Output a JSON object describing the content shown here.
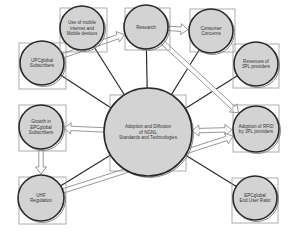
{
  "diagram": {
    "nodes": [
      {
        "id": "upcglobal",
        "lines": [
          "UPCglobal",
          "Subscribers"
        ]
      },
      {
        "id": "mobile",
        "lines": [
          "Use of mobile",
          "internet and",
          "Mobile devices"
        ]
      },
      {
        "id": "research",
        "lines": [
          "Research"
        ]
      },
      {
        "id": "consumer",
        "lines": [
          "Consumer",
          "Concerns"
        ]
      },
      {
        "id": "revenues",
        "lines": [
          "Revenues of",
          "3PL providers"
        ]
      },
      {
        "id": "center",
        "lines": [
          "Adoption and Diffusion",
          "of NGNL",
          "Standards and Technologies"
        ]
      },
      {
        "id": "rfid",
        "lines": [
          "Adoption of RFID",
          "by 3PL providers"
        ]
      },
      {
        "id": "growth",
        "lines": [
          "Growth in",
          "EPCglobal",
          "Subscribers"
        ]
      },
      {
        "id": "uhf",
        "lines": [
          "UHF",
          "Regulation"
        ]
      },
      {
        "id": "enduser",
        "lines": [
          "EPCglobal",
          "End User Ratio"
        ]
      }
    ],
    "line_links": [
      [
        "center",
        "upcglobal"
      ],
      [
        "center",
        "mobile"
      ],
      [
        "center",
        "research"
      ],
      [
        "center",
        "consumer"
      ],
      [
        "center",
        "revenues"
      ],
      [
        "center",
        "uhf"
      ],
      [
        "center",
        "enduser"
      ]
    ],
    "arrow_links": [
      {
        "from": "upcglobal",
        "to": "research",
        "direction": "forward"
      },
      {
        "from": "research",
        "to": "consumer",
        "direction": "forward"
      },
      {
        "from": "research",
        "to": "rfid",
        "direction": "forward"
      },
      {
        "from": "center",
        "to": "rfid",
        "direction": "both"
      },
      {
        "from": "center",
        "to": "growth",
        "direction": "forward"
      },
      {
        "from": "growth",
        "to": "uhf",
        "direction": "forward"
      },
      {
        "from": "uhf",
        "to": "rfid",
        "direction": "forward"
      }
    ]
  }
}
